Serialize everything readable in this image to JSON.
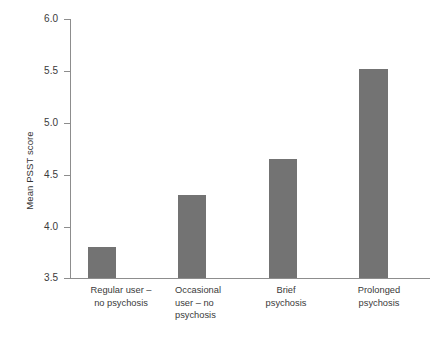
{
  "chart_data": {
    "type": "bar",
    "title": "",
    "subtitle": "",
    "xlabel": "",
    "ylabel": "Mean PSST score",
    "categories": [
      "Regular user –\nno psychosis",
      "Occasional\nuser – no\npsychosis",
      "Brief\npsychosis",
      "Prolonged\npsychosis"
    ],
    "values": [
      3.8,
      4.3,
      4.65,
      5.52
    ],
    "ylim": [
      3.5,
      6.0
    ],
    "ytick_labels": [
      "6.0",
      "5.5",
      "5.0",
      "4.5",
      "4.0",
      "3.5"
    ],
    "ytick_values": [
      6.0,
      5.5,
      5.0,
      4.5,
      4.0,
      3.5
    ],
    "grid": false,
    "legend": null,
    "bar_color": "#737373",
    "axis_color": "#8d8d8d",
    "background_color": "#ffffff",
    "text_color": "#3a3a3a"
  }
}
